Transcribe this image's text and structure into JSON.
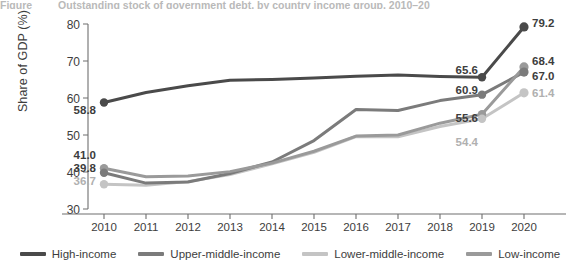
{
  "figure": {
    "title_fragment_number": "Figure",
    "title_fragment_text": "Outstanding stock of government debt, by country income group, 2010–20"
  },
  "axes": {
    "ylabel": "Share of GDP (%)",
    "yticks": [
      "80",
      "70",
      "60",
      "50",
      "40",
      "30"
    ],
    "ylim_min": 30,
    "ylim_max": 80,
    "xticks": [
      "2010",
      "2011",
      "2012",
      "2013",
      "2014",
      "2015",
      "2016",
      "2017",
      "2018",
      "2019",
      "2020"
    ],
    "grid": "off"
  },
  "colors": {
    "high_income": "#4a4a4a",
    "upper_middle_income": "#7b7b7b",
    "lower_middle_income": "#c4c4c4",
    "low_income": "#9a9a9a",
    "axis": "#6f6f6f",
    "text": "#3d3d3d",
    "muted_text": "#b9b9b9"
  },
  "legend": {
    "position": "bottom",
    "items": [
      {
        "label": "High-income",
        "color": "#4a4a4a"
      },
      {
        "label": "Upper-middle-income",
        "color": "#7b7b7b"
      },
      {
        "label": "Lower-middle-income",
        "color": "#c4c4c4"
      },
      {
        "label": "Low-income",
        "color": "#9a9a9a"
      }
    ]
  },
  "point_labels": {
    "start_high": "58.8",
    "start_low": "41.0",
    "start_upper": "39.8",
    "start_lowermid": "36.7",
    "y2019_high": "65.6",
    "y2019_upper": "60.9",
    "y2019_low": "55.6",
    "y2019_lowermid": "54.4",
    "y2020_high": "79.2",
    "y2020_low": "68.4",
    "y2020_upper": "67.0",
    "y2020_lowermid": "61.4"
  },
  "chart_data": {
    "type": "line",
    "title": "Outstanding stock of government debt, by country income group, 2010–20",
    "xlabel": "",
    "ylabel": "Share of GDP (%)",
    "x": [
      2010,
      2011,
      2012,
      2013,
      2014,
      2015,
      2016,
      2017,
      2018,
      2019,
      2020
    ],
    "xlim": [
      2010,
      2020
    ],
    "ylim": [
      30,
      80
    ],
    "yticks": [
      30,
      40,
      50,
      60,
      70,
      80
    ],
    "grid": false,
    "legend_position": "bottom",
    "series": [
      {
        "name": "High-income",
        "color": "#4a4a4a",
        "values": [
          58.8,
          61.5,
          63.3,
          64.8,
          65.0,
          65.4,
          65.9,
          66.2,
          65.8,
          65.6,
          79.2
        ],
        "labeled_points": [
          {
            "x": 2010,
            "y": 58.8,
            "label": "58.8"
          },
          {
            "x": 2019,
            "y": 65.6,
            "label": "65.6"
          },
          {
            "x": 2020,
            "y": 79.2,
            "label": "79.2"
          }
        ]
      },
      {
        "name": "Upper-middle-income",
        "color": "#7b7b7b",
        "values": [
          39.8,
          37.0,
          37.3,
          39.6,
          42.7,
          48.5,
          56.9,
          56.6,
          59.3,
          60.9,
          67.0
        ],
        "labeled_points": [
          {
            "x": 2010,
            "y": 39.8,
            "label": "39.8"
          },
          {
            "x": 2019,
            "y": 60.9,
            "label": "60.9"
          },
          {
            "x": 2020,
            "y": 67.0,
            "label": "67.0"
          }
        ]
      },
      {
        "name": "Lower-middle-income",
        "color": "#c4c4c4",
        "values": [
          36.7,
          36.4,
          37.4,
          39.3,
          42.2,
          45.3,
          49.6,
          49.5,
          52.3,
          54.4,
          61.4
        ],
        "labeled_points": [
          {
            "x": 2010,
            "y": 36.7,
            "label": "36.7"
          },
          {
            "x": 2019,
            "y": 54.4,
            "label": "54.4"
          },
          {
            "x": 2020,
            "y": 61.4,
            "label": "61.4"
          }
        ]
      },
      {
        "name": "Low-income",
        "color": "#9a9a9a",
        "values": [
          41.0,
          38.7,
          38.9,
          40.1,
          42.4,
          45.6,
          49.7,
          50.0,
          53.2,
          55.6,
          68.4
        ],
        "labeled_points": [
          {
            "x": 2010,
            "y": 41.0,
            "label": "41.0"
          },
          {
            "x": 2019,
            "y": 55.6,
            "label": "55.6"
          },
          {
            "x": 2020,
            "y": 68.4,
            "label": "68.4"
          }
        ]
      }
    ]
  }
}
